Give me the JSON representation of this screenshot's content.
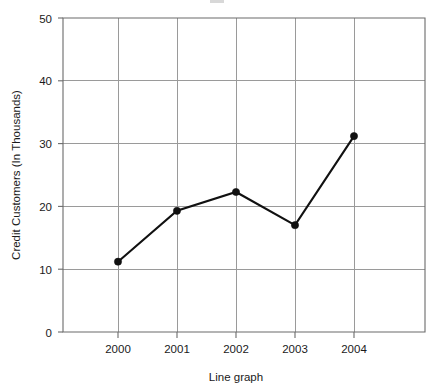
{
  "chart_data": {
    "type": "line",
    "title": "",
    "xlabel": "Line graph",
    "ylabel": "Credit Customers (In Thousands)",
    "categories": [
      "2000",
      "2001",
      "2002",
      "2003",
      "2004"
    ],
    "values": [
      11.2,
      19.3,
      22.3,
      17.0,
      31.2
    ],
    "series": [
      {
        "name": "Credit Customers",
        "values": [
          11.2,
          19.3,
          22.3,
          17.0,
          31.2
        ]
      }
    ],
    "ylim": [
      0,
      50
    ],
    "y_ticks": [
      "0",
      "10",
      "20",
      "30",
      "40",
      "50"
    ],
    "y_tick_values": [
      0,
      10,
      20,
      30,
      40,
      50
    ],
    "x_ticks": [
      "2000",
      "2001",
      "2002",
      "2003",
      "2004"
    ],
    "grid": true,
    "legend": "none",
    "marker": "filled-circle",
    "line_color": "#111111",
    "grid_color": "#9a9a9a",
    "frame_color": "#6b6b6b",
    "background_color": "#ffffff"
  },
  "axis": {
    "y_title": "Credit Customers (In Thousands)",
    "x_title": "Line graph"
  }
}
